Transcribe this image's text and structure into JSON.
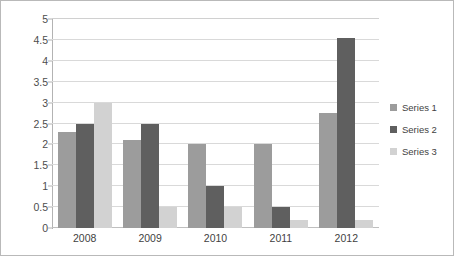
{
  "chart_data": {
    "type": "bar",
    "title": "",
    "xlabel": "",
    "ylabel": "",
    "categories": [
      "2008",
      "2009",
      "2010",
      "2011",
      "2012"
    ],
    "series": [
      {
        "name": "Series 1",
        "color": "#9c9c9c",
        "values": [
          2.3,
          2.1,
          2.0,
          2.0,
          2.75
        ]
      },
      {
        "name": "Series 2",
        "color": "#5f5f5f",
        "values": [
          2.5,
          2.5,
          1.0,
          0.5,
          4.55
        ]
      },
      {
        "name": "Series 3",
        "color": "#d2d2d2",
        "values": [
          3.0,
          0.5,
          0.5,
          0.2,
          0.2
        ]
      }
    ],
    "ylim": [
      0,
      5
    ],
    "yticks": [
      "0",
      "0.5",
      "1",
      "1.5",
      "2",
      "2.5",
      "3",
      "3.5",
      "4",
      "4.5",
      "5"
    ],
    "ytick_values": [
      0,
      0.5,
      1,
      1.5,
      2,
      2.5,
      3,
      3.5,
      4,
      4.5,
      5
    ],
    "grid": true,
    "legend_position": "right",
    "background_color": "#ffffff",
    "gridline_color": "#d9d9d9",
    "axis_color": "#b3b3b3",
    "border_color": "#b9b9b9"
  }
}
